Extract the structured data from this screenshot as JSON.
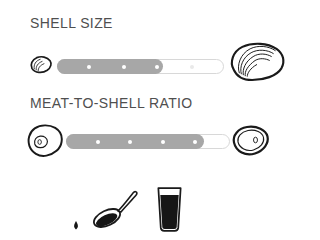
{
  "colors": {
    "background": "#ffffff",
    "title_text": "#4f4f4f",
    "track_fill": "#a7a7a7",
    "track_border": "#d8d8d8",
    "dot_on_fill": "#ffffff",
    "dot_off_fill": "#e9e9e9",
    "illustration_ink": "#1a1a1a"
  },
  "sections": [
    {
      "title": "SHELL SIZE",
      "slider": {
        "fill_percent": 63,
        "dot_positions_percent": [
          19,
          40,
          60,
          81
        ],
        "min_icon": "small-closed-oyster-icon",
        "max_icon": "large-closed-oyster-icon"
      }
    },
    {
      "title": "MEAT-TO-SHELL RATIO",
      "slider": {
        "fill_percent": 84,
        "dot_positions_percent": [
          19,
          39,
          59,
          79
        ],
        "min_icon": "open-oyster-low-meat-icon",
        "max_icon": "open-oyster-high-meat-icon"
      }
    }
  ],
  "footer": {
    "icons": [
      "sauce-spoon-icon",
      "pint-glass-icon"
    ]
  }
}
